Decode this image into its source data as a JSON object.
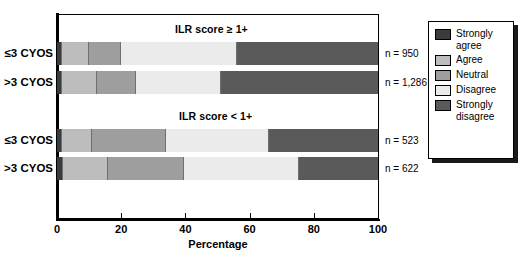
{
  "chart_data": {
    "type": "bar",
    "orientation": "horizontal",
    "stacked": true,
    "stacked_mode": "percent",
    "title": "",
    "xlabel": "Percentage",
    "ylabel": "",
    "xlim": [
      0,
      100
    ],
    "xticks": [
      0,
      20,
      40,
      60,
      80,
      100
    ],
    "xtick_labels": [
      "0",
      "20",
      "40",
      "60",
      "80",
      "100"
    ],
    "grid": false,
    "legend_position": "right-outside",
    "legend_entries": [
      "Strongly agree",
      "Agree",
      "Neutral",
      "Disagree",
      "Strongly disagree"
    ],
    "series": [
      {
        "name": "Strongly agree",
        "color": "#3b3b3b",
        "values": [
          1.5,
          1.5,
          1.5,
          2.0
        ]
      },
      {
        "name": "Agree",
        "color": "#bdbdbd",
        "values": [
          8.5,
          11.0,
          9.5,
          14.0
        ]
      },
      {
        "name": "Neutral",
        "color": "#9e9e9e",
        "values": [
          10.0,
          12.0,
          23.0,
          23.5
        ]
      },
      {
        "name": "Disagree",
        "color": "#ebebeb",
        "values": [
          36.0,
          26.5,
          32.0,
          36.0
        ]
      },
      {
        "name": "Strongly disagree",
        "color": "#5a5a5a",
        "values": [
          44.0,
          49.0,
          34.0,
          24.5
        ]
      }
    ],
    "panels": [
      {
        "title": "ILR score ≥ 1+",
        "categories": [
          "≤3 CYOS",
          ">3 CYOS"
        ],
        "n": [
          "n = 950",
          "n = 1,286"
        ]
      },
      {
        "title": "ILR score < 1+",
        "categories": [
          "≤3 CYOS",
          ">3 CYOS"
        ],
        "n": [
          "n = 523",
          "n = 622"
        ]
      }
    ],
    "bars": [
      {
        "category": "≤3 CYOS",
        "panel": "ILR score ≥ 1+",
        "n_label": "n = 950",
        "segments": [
          1.5,
          8.5,
          10.0,
          36.0,
          44.0
        ]
      },
      {
        "category": ">3 CYOS",
        "panel": "ILR score ≥ 1+",
        "n_label": "n = 1,286",
        "segments": [
          1.5,
          11.0,
          12.0,
          26.5,
          49.0
        ]
      },
      {
        "category": "≤3 CYOS",
        "panel": "ILR score < 1+",
        "n_label": "n = 523",
        "segments": [
          1.5,
          9.5,
          23.0,
          32.0,
          34.0
        ]
      },
      {
        "category": ">3 CYOS",
        "panel": "ILR score < 1+",
        "n_label": "n = 622",
        "segments": [
          2.0,
          14.0,
          23.5,
          36.0,
          24.5
        ]
      }
    ]
  },
  "legend": {
    "items": [
      {
        "label": "Strongly agree",
        "color": "#3b3b3b"
      },
      {
        "label": "Agree",
        "color": "#bdbdbd"
      },
      {
        "label": "Neutral",
        "color": "#9e9e9e"
      },
      {
        "label": "Disagree",
        "color": "#ebebeb"
      },
      {
        "label": "Strongly disagree",
        "color": "#5a5a5a"
      }
    ]
  },
  "axis": {
    "x_title": "Percentage",
    "x_tick_labels": [
      "0",
      "20",
      "40",
      "60",
      "80",
      "100"
    ]
  },
  "panel_titles": {
    "top": "ILR score ≥ 1+",
    "bottom": "ILR score < 1+"
  },
  "category_labels": {
    "b1": "≤3 CYOS",
    "b2": ">3 CYOS",
    "b3": "≤3 CYOS",
    "b4": ">3 CYOS"
  },
  "n_labels": {
    "b1": "n = 950",
    "b2": "n = 1,286",
    "b3": "n = 523",
    "b4": "n = 622"
  }
}
